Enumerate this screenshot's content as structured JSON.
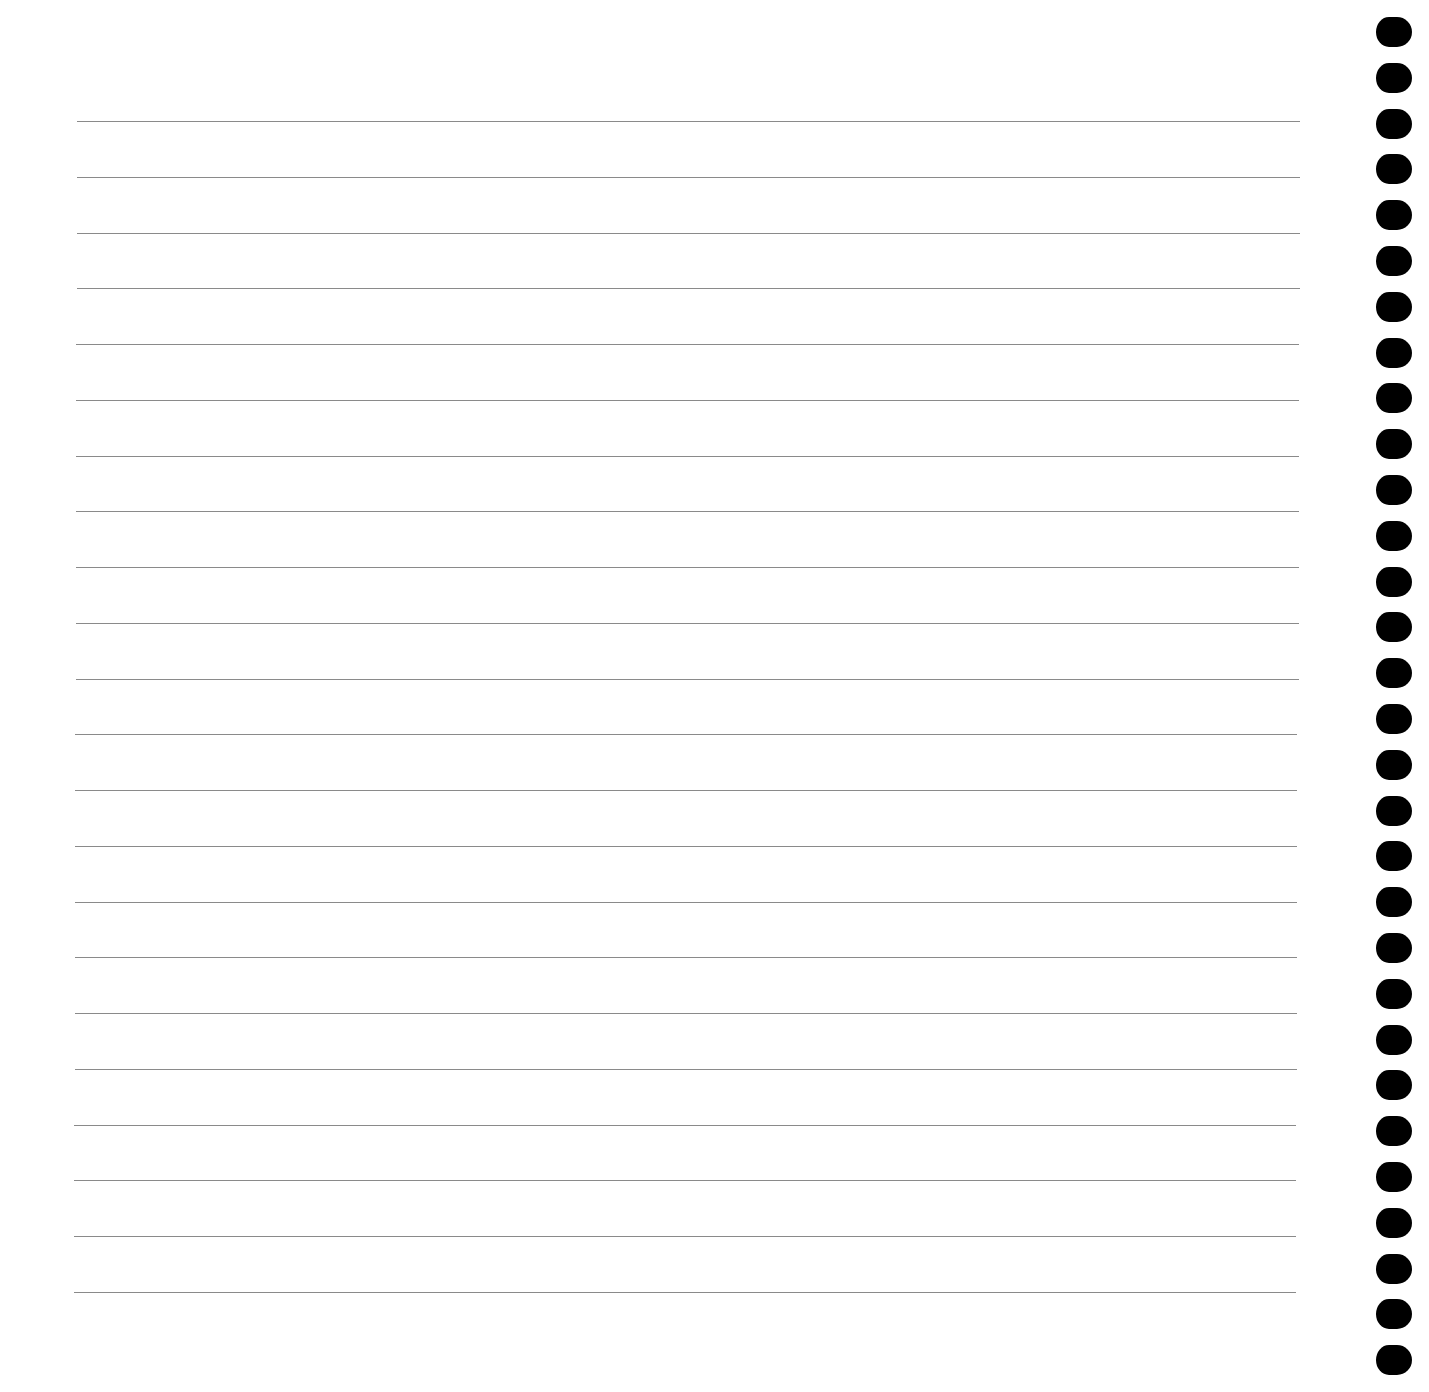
{
  "page": {
    "type": "lined-notebook-page",
    "background": "#ffffff",
    "rule_color": "#8a8a8a",
    "rule_count": 22,
    "rules": {
      "first_y": 121,
      "last_y": 1292,
      "left_x_top": 77,
      "left_x_bottom": 74,
      "right_x_top": 1300,
      "right_x_bottom": 1296
    },
    "binding": {
      "hole_color": "#000000",
      "hole_count": 30,
      "hole_x": 1376,
      "first_center_y": 32,
      "spacing": 45.8
    }
  }
}
